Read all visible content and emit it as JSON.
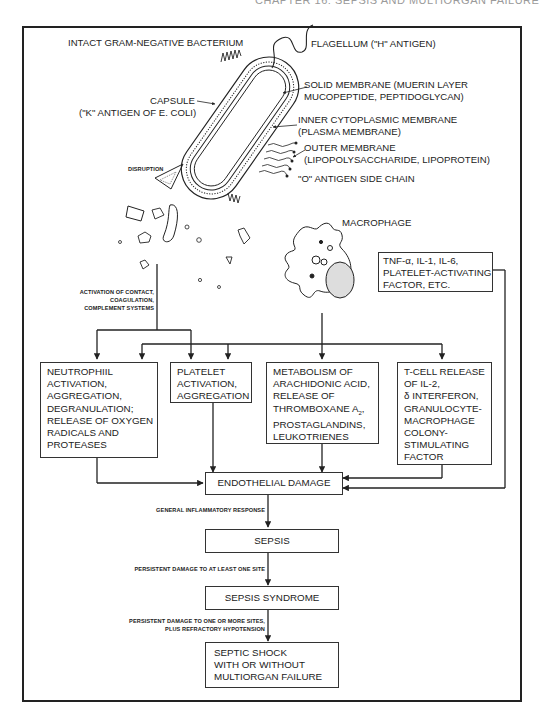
{
  "header": {
    "running_head": "CHAPTER 16: SEPSIS AND MULTIORGAN FAILURE"
  },
  "bacterium": {
    "title": "INTACT GRAM-NEGATIVE BACTERIUM",
    "labels": {
      "flagellum": "FLAGELLUM (\"H\" ANTIGEN)",
      "solid_membrane_1": "SOLID MEMBRANE (MUERIN LAYER",
      "solid_membrane_2": "MUCOPEPTIDE, PEPTIDOGLYCAN)",
      "inner_membrane_1": "INNER CYTOPLASMIC MEMBRANE",
      "inner_membrane_2": "(PLASMA MEMBRANE)",
      "outer_membrane_1": "OUTER MEMBRANE",
      "outer_membrane_2": "(LIPOPOLYSACCHARIDE, LIPOPROTEIN)",
      "o_antigen": "\"O\" ANTIGEN SIDE CHAIN",
      "capsule_1": "CAPSULE",
      "capsule_2": "(\"K\" ANTIGEN OF E. COLI)",
      "disruption": "DISRUPTION"
    }
  },
  "macrophage": {
    "label": "MACROPHAGE"
  },
  "cytokines_box": {
    "lines": [
      "TNF-α, IL-1, IL-6,",
      "PLATELET-ACTIVATING",
      "FACTOR, ETC."
    ]
  },
  "activation_label": {
    "lines": [
      "ACTIVATION OF CONTACT,",
      "COAGULATION,",
      "COMPLEMENT SYSTEMS"
    ]
  },
  "effect_boxes": [
    {
      "lines": [
        "NEUTROPHIIL",
        "ACTIVATION,",
        "AGGREGATION,",
        "DEGRANULATION;",
        "RELEASE OF OXYGEN",
        "RADICALS AND",
        "PROTEASES"
      ]
    },
    {
      "lines": [
        "PLATELET",
        "ACTIVATION,",
        "AGGREGATION"
      ]
    },
    {
      "lines": [
        "METABOLISM OF",
        "ARACHIDONIC ACID,",
        "RELEASE OF",
        "THROMBOXANE A",
        "PROSTAGLANDINS,",
        "LEUKOTRIENES"
      ],
      "subscript": "2"
    },
    {
      "lines": [
        "T-CELL RELEASE",
        "OF IL-2,",
        "δ INTERFERON,",
        "GRANULOCYTE-",
        "MACROPHAGE",
        "COLONY-",
        "STIMULATING",
        "FACTOR"
      ]
    }
  ],
  "cascade": {
    "endothelial_damage": "ENDOTHELIAL DAMAGE",
    "arrow1_label": "GENERAL INFLAMMATORY RESPONSE",
    "sepsis": "SEPSIS",
    "arrow2_label": "PERSISTENT DAMAGE TO AT LEAST ONE SITE",
    "sepsis_syndrome": "SEPSIS SYNDROME",
    "arrow3_label_1": "PERSISTENT DAMAGE TO ONE OR MORE SITES,",
    "arrow3_label_2": "PLUS REFRACTORY HYPOTENSION",
    "septic_shock": [
      "SEPTIC SHOCK",
      "WITH OR WITHOUT",
      "MULTIORGAN FAILURE"
    ]
  }
}
